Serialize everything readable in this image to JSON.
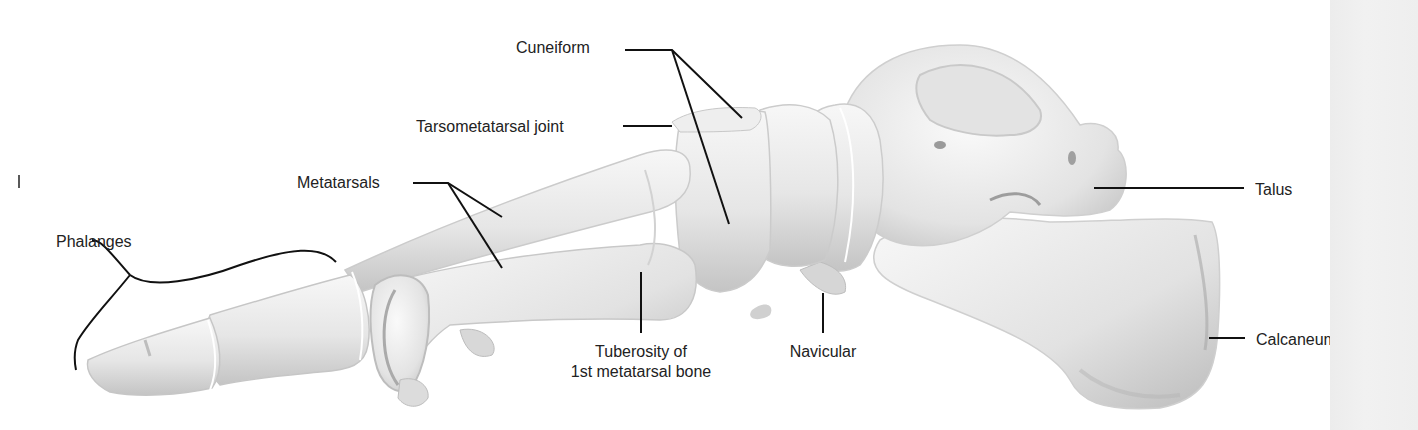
{
  "diagram": {
    "colors": {
      "background": "#ffffff",
      "bone_light": "#f4f4f4",
      "bone_shadow": "#bdbdbd",
      "leader": "#111111",
      "text": "#222222",
      "side_strip": "#eeeeee"
    },
    "labels": {
      "cuneiform": "Cuneiform",
      "tarsometatarsal_joint": "Tarsometatarsal joint",
      "metatarsals": "Metatarsals",
      "phalanges": "Phalanges",
      "tuberosity_line1": "Tuberosity of",
      "tuberosity_line2": "1st metatarsal bone",
      "navicular": "Navicular",
      "talus": "Talus",
      "calcaneum": "Calcaneum"
    }
  }
}
